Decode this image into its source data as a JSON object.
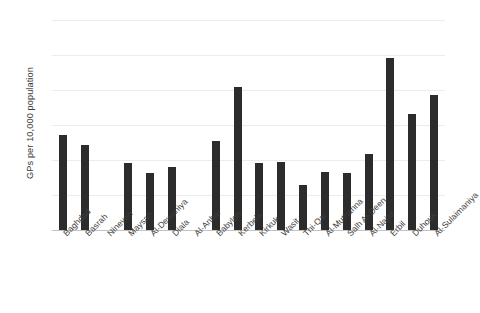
{
  "chart_data": {
    "type": "bar",
    "title": "",
    "xlabel": "",
    "ylabel": "GPs per 10,000 population",
    "ylim": [
      0,
      12
    ],
    "yticks": [
      0,
      2,
      4,
      6,
      8,
      10,
      12
    ],
    "ytick_labels": [
      "0",
      "2",
      "4",
      "6",
      "8",
      "10",
      "12"
    ],
    "grid": true,
    "legend": null,
    "bar_color": "#2c2c2c",
    "gridline_color": "#ececed",
    "axis_color": "#c2c2c2",
    "categories": [
      "Baghdad",
      "Basrah",
      "Nineveh",
      "Maysan",
      "Al-Dewaniya",
      "Diala",
      "Al-Anbar",
      "Babylon",
      "Kerbela",
      "Kirkuk",
      "Wasit",
      "Thi-Qar",
      "Al-Muthanna",
      "Salh Al-Deen",
      "Al-Najaf",
      "Erbil",
      "Duhouk",
      "Al-Sulaimaniya"
    ],
    "values": [
      5.45,
      4.85,
      0,
      3.85,
      3.25,
      3.6,
      0,
      5.1,
      8.15,
      3.85,
      3.9,
      2.6,
      3.3,
      3.25,
      4.35,
      9.85,
      6.65,
      7.7
    ]
  }
}
